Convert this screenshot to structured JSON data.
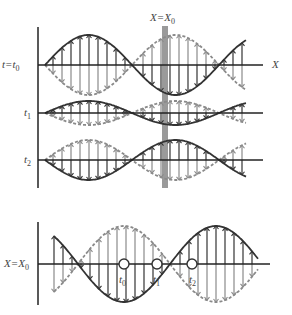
{
  "labels": {
    "position_marker": "X=X",
    "position_marker_sub": "0",
    "x_axis": "X",
    "row_t0": "t=t",
    "row_t0_sub": "0",
    "row_t1": "t",
    "row_t1_sub": "1",
    "row_t2": "t",
    "row_t2_sub": "2",
    "bottom_axis": "X=X",
    "bottom_axis_sub": "0",
    "point_t0": "t",
    "point_t0_sub": "0",
    "point_t1": "t",
    "point_t1_sub": "1",
    "point_t2": "t",
    "point_t2_sub": "2"
  },
  "colors": {
    "solid_wave": "#333333",
    "dashed_wave": "#8a8a8a",
    "marker_bar": "#9a9a9a",
    "axis": "#222222"
  },
  "top_panel": {
    "rows": [
      {
        "name": "t0",
        "axis_y": 65,
        "amplitude": 30,
        "phase_sign": 1
      },
      {
        "name": "t1",
        "axis_y": 113,
        "amplitude": 12,
        "phase_sign": 1
      },
      {
        "name": "t2",
        "axis_y": 160,
        "amplitude": 20,
        "phase_sign": -1
      }
    ],
    "x_start": 45,
    "x_end": 246,
    "half_wavelength": 87
  },
  "bottom_panel": {
    "axis_y": 264,
    "amplitude": 38,
    "x_start": 54,
    "x_end": 258,
    "points": [
      124,
      157,
      192
    ]
  }
}
